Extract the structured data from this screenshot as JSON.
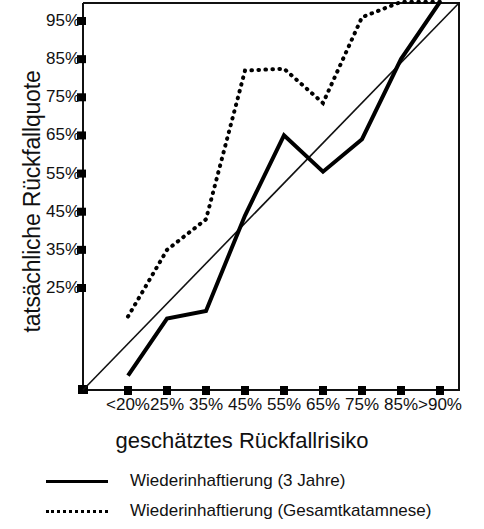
{
  "chart_data": {
    "type": "line",
    "title": "",
    "xlabel": "geschätztes Rückfallrisiko",
    "ylabel": "tatsächliche Rückfallquote",
    "categories": [
      "<20%",
      "25%",
      "35%",
      "45%",
      "55%",
      "65%",
      "75%",
      "85%",
      ">90%"
    ],
    "ytick_labels": [
      "25%",
      "35%",
      "45%",
      "55%",
      "65%",
      "75%",
      "85%",
      "95%"
    ],
    "ytick_values": [
      25,
      35,
      45,
      55,
      65,
      75,
      85,
      95
    ],
    "ylim": [
      0,
      100
    ],
    "xlim": [
      0,
      10
    ],
    "grid": false,
    "legend_position": "below",
    "series": [
      {
        "name": "Wiederinhaftierung (3 Jahre)",
        "style": "solid",
        "color": "#000000",
        "values": [
          2,
          17,
          19,
          44,
          65,
          55.5,
          64,
          85,
          100
        ]
      },
      {
        "name": "Wiederinhaftierung (Gesamtkatamnese)",
        "style": "dotted",
        "color": "#000000",
        "values": [
          17.5,
          35,
          43,
          82,
          82.5,
          73.5,
          96,
          100,
          100
        ]
      },
      {
        "name": "Referenzdiagonale",
        "style": "thin-solid",
        "color": "#000000",
        "values": [
          0,
          12.5,
          25,
          37.5,
          50,
          62.5,
          75,
          87.5,
          100
        ]
      }
    ]
  },
  "axes": {
    "y_title": "tatsächliche Rückfallquote",
    "x_title": "geschätztes Rückfallrisiko"
  },
  "legend": {
    "items": [
      {
        "label": "Wiederinhaftierung (3 Jahre)",
        "style": "solid"
      },
      {
        "label": "Wiederinhaftierung (Gesamtkatamnese)",
        "style": "dotted"
      }
    ]
  }
}
